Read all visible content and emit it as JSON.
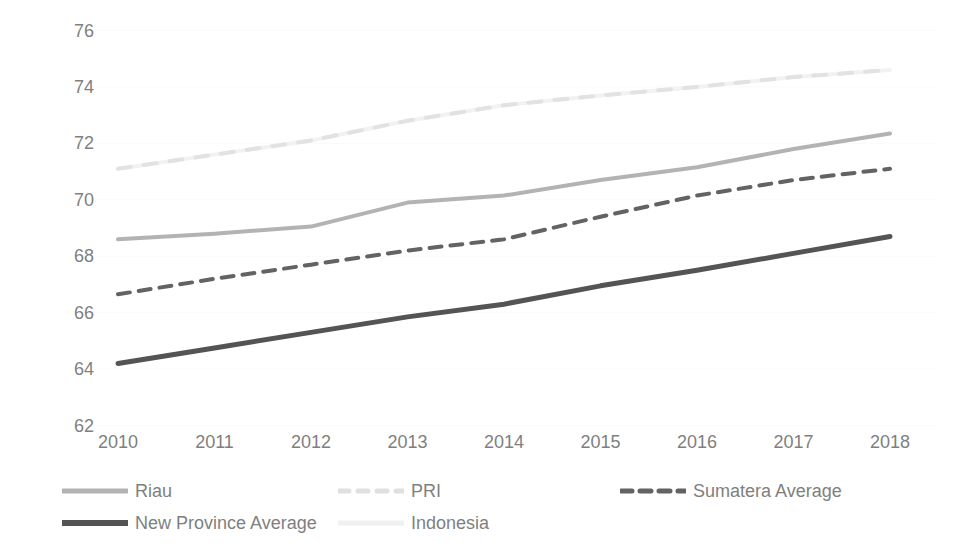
{
  "chart_data": {
    "type": "line",
    "title": "",
    "xlabel": "",
    "ylabel": "Index",
    "categories": [
      "2010",
      "2011",
      "2012",
      "2013",
      "2014",
      "2015",
      "2016",
      "2017",
      "2018"
    ],
    "x": [
      2010,
      2011,
      2012,
      2013,
      2014,
      2015,
      2016,
      2017,
      2018
    ],
    "ylim": [
      62,
      76
    ],
    "y_ticks": [
      62,
      64,
      66,
      68,
      70,
      72,
      74,
      76
    ],
    "grid": true,
    "legend_position": "bottom",
    "series": [
      {
        "name": "Riau",
        "color": "#b3b3b3",
        "style": "solid",
        "width": 4,
        "values": [
          68.6,
          68.8,
          69.05,
          69.9,
          70.15,
          70.7,
          71.15,
          71.8,
          72.35
        ]
      },
      {
        "name": "PRI",
        "color": "#e2e2e2",
        "style": "dashed",
        "width": 4,
        "values": [
          71.1,
          71.6,
          72.1,
          72.8,
          73.35,
          73.7,
          74.0,
          74.35,
          74.6
        ]
      },
      {
        "name": "Sumatera Average",
        "color": "#636363",
        "style": "dashed",
        "width": 4,
        "values": [
          66.65,
          67.2,
          67.7,
          68.2,
          68.6,
          69.4,
          70.15,
          70.7,
          71.1
        ]
      },
      {
        "name": "New Province Average",
        "color": "#545454",
        "style": "solid",
        "width": 5,
        "values": [
          64.2,
          64.75,
          65.3,
          65.85,
          66.3,
          66.95,
          67.5,
          68.1,
          68.7
        ]
      },
      {
        "name": "Indonesia",
        "color": "#f2f2f2",
        "style": "solid",
        "width": 4,
        "values": [
          71.1,
          71.6,
          72.1,
          72.8,
          73.35,
          73.7,
          74.0,
          74.35,
          74.6
        ]
      }
    ]
  },
  "axes": {
    "y_title": "Index",
    "y_tick_labels": [
      "76",
      "74",
      "72",
      "70",
      "68",
      "66",
      "64",
      "62"
    ],
    "x_tick_labels": [
      "2010",
      "2011",
      "2012",
      "2013",
      "2014",
      "2015",
      "2016",
      "2017",
      "2018"
    ]
  },
  "legend": {
    "items": [
      {
        "label": "Riau",
        "swatch": "solid-line-swatch",
        "color": "#b3b3b3",
        "dash": "none",
        "width": 5,
        "row": 0,
        "col": 0
      },
      {
        "label": "PRI",
        "swatch": "dashed-line-swatch",
        "color": "#e0e0e0",
        "dash": "10,9",
        "width": 5,
        "row": 0,
        "col": 1
      },
      {
        "label": "Sumatera Average",
        "swatch": "dashed-line-swatch",
        "color": "#636363",
        "dash": "11,8",
        "width": 5,
        "row": 0,
        "col": 2
      },
      {
        "label": "New Province Average",
        "swatch": "solid-line-swatch",
        "color": "#545454",
        "dash": "none",
        "width": 6,
        "row": 1,
        "col": 0
      },
      {
        "label": "Indonesia",
        "swatch": "solid-line-swatch",
        "color": "#f0f0f0",
        "dash": "none",
        "width": 5,
        "row": 1,
        "col": 1
      }
    ]
  },
  "colors": {
    "background": "#ffffff",
    "text": "#7f7f7f",
    "gridline": "#fafafa"
  }
}
